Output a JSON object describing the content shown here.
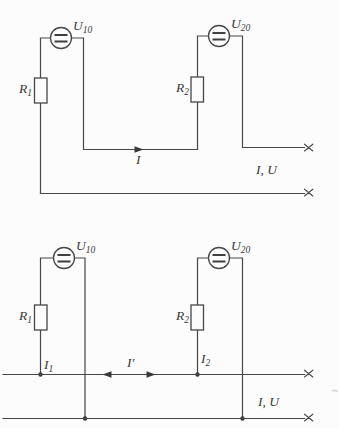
{
  "meta": {
    "background_color": "#fcfcfc",
    "line_color": "#474747",
    "text_color": "#3a3a3a"
  },
  "top_circuit": {
    "source1": {
      "base": "U",
      "sub": "10"
    },
    "source2": {
      "base": "U",
      "sub": "20"
    },
    "resistor1": {
      "base": "R",
      "sub": "1"
    },
    "resistor2": {
      "base": "R",
      "sub": "2"
    },
    "current": "I",
    "terminal_label": "I, U"
  },
  "bottom_circuit": {
    "source1": {
      "base": "U",
      "sub": "10"
    },
    "source2": {
      "base": "U",
      "sub": "20"
    },
    "resistor1": {
      "base": "R",
      "sub": "1"
    },
    "resistor2": {
      "base": "R",
      "sub": "2"
    },
    "current1": {
      "base": "I",
      "sub": "1"
    },
    "current2": {
      "base": "I",
      "sub": "2"
    },
    "loop_current": "I′",
    "terminal_label": "I, U"
  }
}
